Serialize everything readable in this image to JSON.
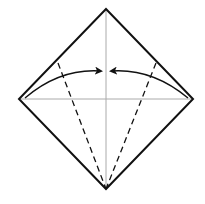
{
  "diagram": {
    "type": "origami-fold-step",
    "background": "#ffffff",
    "square": {
      "top": [
        106,
        9
      ],
      "right": [
        193,
        99
      ],
      "bottom": [
        106,
        189
      ],
      "left": [
        19,
        99
      ],
      "stroke": "#111111",
      "stroke_width": 2
    },
    "crease_lines": {
      "vertical": {
        "from": [
          106,
          9
        ],
        "to": [
          106,
          189
        ]
      },
      "horizontal": {
        "from": [
          19,
          99
        ],
        "to": [
          193,
          99
        ]
      },
      "stroke": "#aaaaaa",
      "stroke_width": 1
    },
    "valley_folds": [
      {
        "from": [
          58,
          63
        ],
        "to": [
          106,
          189
        ]
      },
      {
        "from": [
          156,
          63
        ],
        "to": [
          106,
          189
        ]
      }
    ],
    "valley_fold_style": {
      "stroke": "#111111",
      "stroke_width": 1.3,
      "dash": "6 4"
    },
    "arrows": [
      {
        "name": "left-fold-arrow",
        "start": [
          25,
          98
        ],
        "control": [
          60,
          68
        ],
        "end": [
          101,
          71
        ]
      },
      {
        "name": "right-fold-arrow",
        "start": [
          188,
          98
        ],
        "control": [
          152,
          68
        ],
        "end": [
          111,
          71
        ]
      }
    ],
    "arrow_style": {
      "stroke": "#111111",
      "stroke_width": 1.4
    },
    "instruction": "Fold left and right edges to the center crease"
  }
}
